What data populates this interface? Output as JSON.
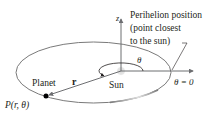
{
  "diagram": {
    "labels": {
      "perihelion_line1": "Perihelion position",
      "perihelion_line2": "(point closest",
      "perihelion_line3": "to the sun)",
      "z_axis": "z",
      "theta": "θ",
      "theta_zero": "θ = 0",
      "planet": "Planet",
      "r_vector": "r",
      "sun": "Sun",
      "point": "P(r, θ)"
    },
    "colors": {
      "orbit": "#7a7a7a",
      "axis": "#6d6e71",
      "text": "#231f20",
      "sun": "#c8c8c8",
      "planet": "#000000"
    }
  }
}
